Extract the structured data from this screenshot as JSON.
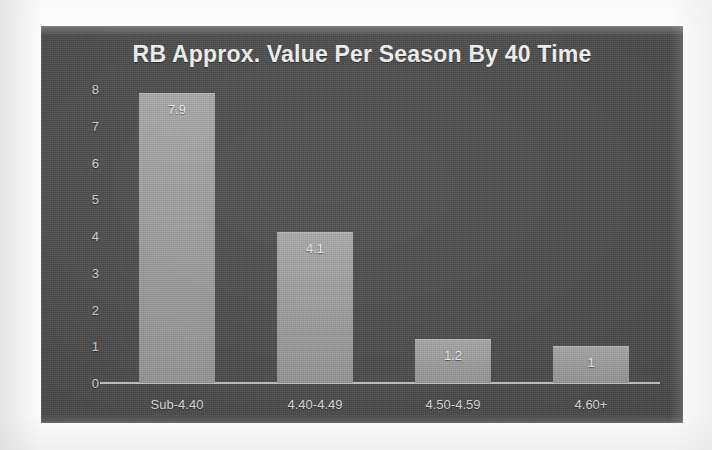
{
  "chart_data": {
    "type": "bar",
    "title": "RB Approx. Value Per Season By 40 Time",
    "xlabel": "",
    "ylabel": "",
    "categories": [
      "Sub-4.40",
      "4.40-4.49",
      "4.50-4.59",
      "4.60+"
    ],
    "values": [
      7.9,
      4.1,
      1.2,
      1
    ],
    "value_labels": [
      "7.9",
      "4.1",
      "1.2",
      "1"
    ],
    "ylim": [
      0,
      8
    ],
    "ytick_labels": [
      "8",
      "7",
      "6",
      "5",
      "4",
      "3",
      "2",
      "1",
      "0"
    ],
    "ytick_values": [
      8,
      7,
      6,
      5,
      4,
      3,
      2,
      1,
      0
    ],
    "grid": false,
    "legend": false,
    "legend_position": "none",
    "colors": {
      "panel_background": "#4a4a4a",
      "page_background": "#fdfdfd",
      "bar_fill": "#9c9c9c",
      "title_text": "#f2f2f2",
      "tick_text": "#cfcfcf",
      "category_text": "#d8d8d8",
      "axis_line": "#d4d4d4",
      "value_label_text": "#f0f0f0"
    }
  }
}
